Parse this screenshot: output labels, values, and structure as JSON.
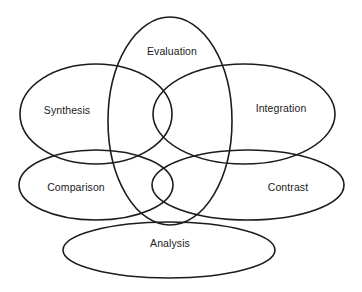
{
  "diagram": {
    "type": "venn",
    "background_color": "#ffffff",
    "stroke_color": "#1c1c1c",
    "label_color": "#1a1a1a",
    "canvas": {
      "width": 362,
      "height": 292
    },
    "sets": [
      {
        "id": "evaluation",
        "label": "Evaluation",
        "shape": "ellipse",
        "cx": 170,
        "cy": 121,
        "rx": 62,
        "ry": 104,
        "rotation": 0,
        "label_x": 172,
        "label_y": 52
      },
      {
        "id": "synthesis",
        "label": "Synthesis",
        "shape": "ellipse",
        "cx": 96,
        "cy": 114,
        "rx": 76,
        "ry": 50,
        "rotation": 0,
        "label_x": 67,
        "label_y": 111
      },
      {
        "id": "integration",
        "label": "Integration",
        "shape": "ellipse",
        "cx": 244,
        "cy": 114,
        "rx": 91,
        "ry": 50,
        "rotation": 0,
        "label_x": 281,
        "label_y": 109
      },
      {
        "id": "comparison",
        "label": "Comparison",
        "shape": "ellipse",
        "cx": 96,
        "cy": 185,
        "rx": 77,
        "ry": 35,
        "rotation": 0,
        "label_x": 76,
        "label_y": 188
      },
      {
        "id": "contrast",
        "label": "Contrast",
        "shape": "ellipse",
        "cx": 248,
        "cy": 185,
        "rx": 96,
        "ry": 35,
        "rotation": 0,
        "label_x": 288,
        "label_y": 188
      },
      {
        "id": "analysis",
        "label": "Analysis",
        "shape": "ellipse",
        "cx": 169,
        "cy": 250,
        "rx": 106,
        "ry": 28,
        "rotation": 0,
        "label_x": 170,
        "label_y": 244
      }
    ]
  }
}
